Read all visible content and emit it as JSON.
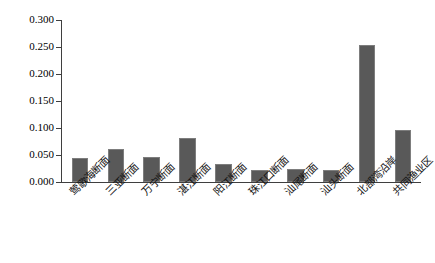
{
  "chart_data": {
    "type": "bar",
    "title": "",
    "xlabel": "",
    "ylabel": "",
    "ylim": [
      0.0,
      0.3
    ],
    "grid": false,
    "legend": "none",
    "bar_color": "#595959",
    "axis_color": "#3f3f3f",
    "ytick_labels": [
      "0.300",
      "0.250",
      "0.200",
      "0.150",
      "0.100",
      "0.050",
      "0.000"
    ],
    "ytick_values": [
      0.3,
      0.25,
      0.2,
      0.15,
      0.1,
      0.05,
      0.0
    ],
    "categories": [
      "莺歌海断面",
      "三亚断面",
      "万宁断面",
      "湛江断面",
      "阳江断面",
      "珠江口断面",
      "汕尾断面",
      "汕头断面",
      "北部湾沿岸",
      "共同渔业区"
    ],
    "values": [
      0.044,
      0.061,
      0.047,
      0.081,
      0.033,
      0.022,
      0.024,
      0.023,
      0.254,
      0.096
    ]
  }
}
